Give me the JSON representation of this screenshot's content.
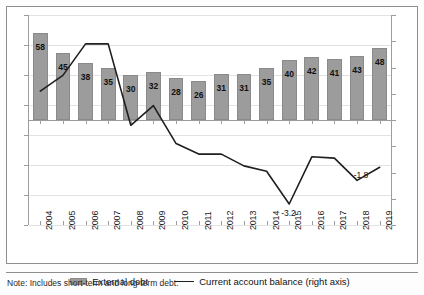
{
  "chart_data": {
    "type": "bar",
    "title": "",
    "subtitle": "",
    "xlabel": "",
    "ylabel": "",
    "grid": true,
    "legend_position": "bottom",
    "categories": [
      "2004",
      "2005",
      "2006",
      "2007",
      "2008",
      "2009",
      "2010",
      "2011",
      "2012",
      "2013",
      "2014",
      "2015",
      "2016",
      "2017",
      "2018",
      "2019"
    ],
    "left_axis": {
      "label": "",
      "ylim": [
        -70,
        70
      ],
      "ticks": [
        "70",
        "50",
        "30",
        "10",
        "-10",
        "-30",
        "-50",
        "-70"
      ],
      "tick_values": [
        70,
        50,
        30,
        10,
        -10,
        -30,
        -50,
        -70
      ]
    },
    "right_axis": {
      "label": "right axis",
      "ylim": [
        -4,
        4
      ],
      "ticks": [
        "4",
        "3",
        "2",
        "1",
        "0",
        "-1",
        "-2",
        "-3",
        "-4"
      ],
      "tick_values": [
        4,
        3,
        2,
        1,
        0,
        -1,
        -2,
        -3,
        -4
      ]
    },
    "series": [
      {
        "name": "External debt",
        "type": "bar",
        "axis": "left",
        "color": "#9c9c9c",
        "values": [
          58,
          45,
          38,
          35,
          30,
          32,
          28,
          26,
          31,
          31,
          35,
          40,
          42,
          41,
          43,
          48
        ],
        "labels": [
          "58",
          "45",
          "38",
          "35",
          "30",
          "32",
          "28",
          "26",
          "31",
          "31",
          "35",
          "40",
          "42",
          "41",
          "43",
          "48"
        ]
      },
      {
        "name": "Current account balance (right axis)",
        "type": "line",
        "axis": "right",
        "color": "#1f1f1f",
        "values": [
          1.1,
          1.7,
          2.9,
          2.9,
          -0.2,
          0.55,
          -0.9,
          -1.3,
          -1.3,
          -1.75,
          -1.95,
          -3.2,
          -1.4,
          -1.45,
          -2.3,
          -1.8
        ],
        "point_labels": {
          "2015": "-3.2",
          "2019": "-1.8"
        }
      }
    ]
  },
  "legend": {
    "items": [
      {
        "label": "External debt",
        "marker": "bar-swatch-icon"
      },
      {
        "label": "Current account balance (right axis)",
        "marker": "line-swatch-icon"
      }
    ]
  },
  "footnote": {
    "text": "Note: Includes short-term and long-term debt."
  }
}
